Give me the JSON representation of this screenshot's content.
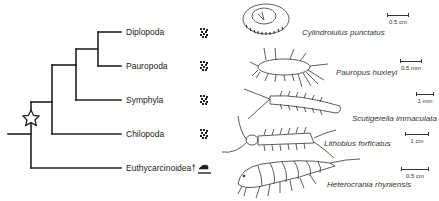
{
  "figure": {
    "type": "phylogenetic-tree",
    "root_marker": "star",
    "taxa": [
      {
        "name": "Diplopoda",
        "habitat_icon": "soil-icon",
        "species": "Cylindroiulus punctatus",
        "scale": "0.5 cm"
      },
      {
        "name": "Pauropoda",
        "habitat_icon": "soil-icon",
        "species": "Pauropus huxleyi",
        "scale": "0.5 mm"
      },
      {
        "name": "Symphyla",
        "habitat_icon": "soil-icon",
        "species": "Scutigerella immaculata",
        "scale": "1 mm"
      },
      {
        "name": "Chilopoda",
        "habitat_icon": "soil-icon",
        "species": "Lithobius forficatus",
        "scale": "1 cm"
      },
      {
        "name": "Euthycarcinoidea†",
        "habitat_icon": "shoreline-water-icon",
        "species": "Heterocrania rhyniensis",
        "scale": "0.5 cm"
      }
    ],
    "topology": "((((Diplopoda,Pauropoda),Symphyla),Chilopoda),Euthycarcinoidea)"
  },
  "colors": {
    "line": "#222222",
    "background": "#ffffff"
  }
}
